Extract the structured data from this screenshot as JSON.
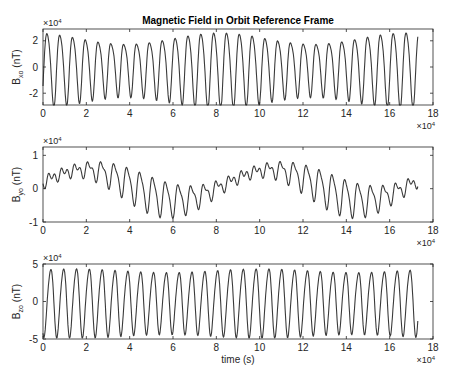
{
  "figure": {
    "title": "Magnetic Field in Orbit Reference Frame",
    "background": "#ffffff",
    "line_color": "#3a3a3a",
    "axis_color": "#262626"
  },
  "chart_data": [
    {
      "type": "line",
      "title": "Magnetic Field in Orbit Reference Frame",
      "xlabel": "",
      "ylabel_main": "B",
      "ylabel_sub": "xo",
      "ylabel_unit": "(nT)",
      "xlim": [
        0,
        18
      ],
      "ylim": [
        -2.9,
        2.9
      ],
      "x_multiplier": "×10",
      "x_exponent": "4",
      "y_multiplier": "×10",
      "y_exponent": "4",
      "xticks": [
        0,
        2,
        4,
        6,
        8,
        10,
        12,
        14,
        16,
        18
      ],
      "yticks": [
        -2,
        0,
        2
      ],
      "ytick_labels": [
        "-2",
        "0",
        "2"
      ],
      "grid": false,
      "x_range_data": [
        0,
        17.3
      ],
      "model": {
        "period": 0.592,
        "phase": 0.05,
        "amp_base": 2.45,
        "amp_var": 0.45,
        "amp_var_period": 8.6,
        "amp_var_phase": 1.9,
        "harmonic2": 0.38,
        "harmonic2_phase": 1.1,
        "slow_term": 0.0,
        "slow_period": 8.6,
        "slow_phase": 0,
        "offset": 0.0,
        "clip": 2.9,
        "step": 0.025
      },
      "notes": "Oscillation ~29 cycles over 0–17.3×10^4 s, peaks ~±2.2 to ±2.9×10^4 nT with shoulder on rising edge"
    },
    {
      "type": "line",
      "xlabel": "",
      "ylabel_main": "B",
      "ylabel_sub": "yo",
      "ylabel_unit": "(nT)",
      "xlim": [
        0,
        18
      ],
      "ylim": [
        -1.0,
        1.25
      ],
      "x_multiplier": "×10",
      "x_exponent": "4",
      "y_multiplier": "×10",
      "y_exponent": "4",
      "xticks": [
        0,
        2,
        4,
        6,
        8,
        10,
        12,
        14,
        16,
        18
      ],
      "yticks": [
        -1,
        0,
        1
      ],
      "ytick_labels": [
        "-1",
        "0",
        "1"
      ],
      "grid": false,
      "x_range_data": [
        0,
        17.3
      ],
      "model": {
        "period": 0.592,
        "phase": 0.2,
        "amp_base": 0.32,
        "amp_var": 0.22,
        "amp_var_period": 8.6,
        "amp_var_phase": 4.2,
        "harmonic2": 0.12,
        "harmonic2_phase": 0.6,
        "slow_term": 0.45,
        "slow_period": 8.6,
        "slow_phase": -0.25,
        "offset": 0.12,
        "clip": 1.25,
        "step": 0.025
      },
      "notes": "Slow envelope ~8.6×10^4 s; highs ~1.2×10^4 around t≈2.5–3 and 11–12 ×10^4; lows ~-0.9×10^4 around t≈7 and 16 ×10^4"
    },
    {
      "type": "line",
      "xlabel": "time (s)",
      "ylabel_main": "B",
      "ylabel_sub": "zo",
      "ylabel_unit": "(nT)",
      "xlim": [
        0,
        18
      ],
      "ylim": [
        -5,
        5
      ],
      "x_multiplier": "×10",
      "x_exponent": "4",
      "y_multiplier": "×10",
      "y_exponent": "4",
      "xticks": [
        0,
        2,
        4,
        6,
        8,
        10,
        12,
        14,
        16,
        18
      ],
      "yticks": [
        -5,
        0,
        5
      ],
      "ytick_labels": [
        "-5",
        "0",
        "5"
      ],
      "grid": false,
      "x_range_data": [
        0,
        17.3
      ],
      "model": {
        "period": 0.592,
        "phase": 0.2,
        "amp_base": 4.35,
        "amp_var": 0.25,
        "amp_var_period": 8.6,
        "amp_var_phase": 0.5,
        "harmonic2": 0.45,
        "harmonic2_phase": 2.4,
        "slow_term": 0.0,
        "slow_period": 8.6,
        "slow_phase": 0,
        "offset": 0.0,
        "clip": 4.85,
        "step": 0.025
      },
      "notes": "Regular oscillation peaks ≈ +4.4×10^4, troughs ≈ -4.5×10^4, ~29 cycles"
    }
  ],
  "layout": {
    "axes": [
      {
        "left": 43,
        "top": 29,
        "width": 390,
        "height": 76
      },
      {
        "left": 43,
        "top": 147,
        "width": 390,
        "height": 75
      },
      {
        "left": 43,
        "top": 264,
        "width": 390,
        "height": 75
      }
    ]
  }
}
